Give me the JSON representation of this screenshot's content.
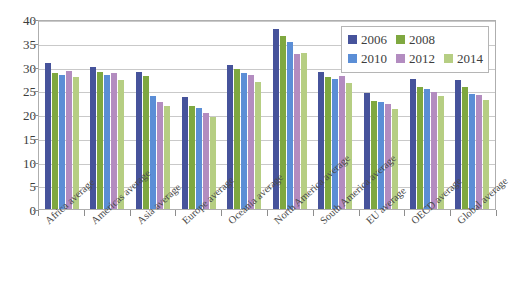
{
  "chart_data": {
    "type": "bar",
    "title": "",
    "subtitle": "",
    "xlabel": "",
    "ylabel": "",
    "ylim": [
      0,
      40
    ],
    "ytick_step": 5,
    "yticks": [
      40,
      35,
      30,
      25,
      20,
      15,
      10,
      5,
      0
    ],
    "grid": true,
    "grid_axis": "y",
    "legend_position": "top-right-inside",
    "categories": [
      "Africa average",
      "Americas average",
      "Asia average",
      "Europe average",
      "Oceania average",
      "North America average",
      "South America average",
      "EU average",
      "OECD average",
      "Global average"
    ],
    "series": [
      {
        "name": "2006",
        "color": "#46539b",
        "values": [
          30.8,
          30.0,
          28.8,
          23.5,
          30.3,
          37.8,
          28.8,
          24.5,
          27.3,
          27.1
        ]
      },
      {
        "name": "2008",
        "color": "#7fa840",
        "values": [
          28.6,
          28.8,
          27.9,
          21.7,
          29.4,
          36.4,
          27.7,
          22.8,
          25.6,
          25.7
        ]
      },
      {
        "name": "2010",
        "color": "#5b8ed6",
        "values": [
          28.3,
          28.2,
          23.8,
          21.3,
          28.7,
          35.2,
          27.3,
          22.6,
          25.3,
          24.3
        ]
      },
      {
        "name": "2012",
        "color": "#b38cc0",
        "values": [
          29.0,
          28.6,
          22.6,
          20.3,
          28.3,
          32.6,
          27.9,
          22.1,
          24.7,
          24.0
        ]
      },
      {
        "name": "2014",
        "color": "#b6ce83",
        "values": [
          27.7,
          27.2,
          21.7,
          19.4,
          26.8,
          32.9,
          26.5,
          21.0,
          23.7,
          23.0
        ]
      }
    ]
  },
  "legend": {
    "rows": [
      [
        {
          "label": "2006",
          "color": "#46539b"
        },
        {
          "label": "2008",
          "color": "#7fa840"
        }
      ],
      [
        {
          "label": "2010",
          "color": "#5b8ed6"
        },
        {
          "label": "2012",
          "color": "#b38cc0"
        },
        {
          "label": "2014",
          "color": "#b6ce83"
        }
      ]
    ]
  },
  "caption": {
    "text": ""
  }
}
